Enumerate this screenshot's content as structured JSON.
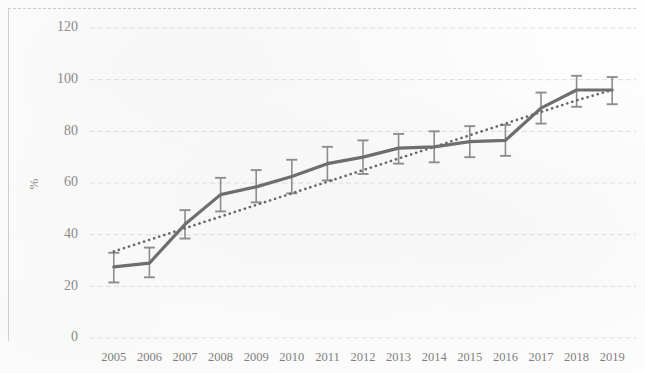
{
  "chart_data": {
    "type": "line",
    "title": "",
    "xlabel": "",
    "ylabel": "%",
    "ylim": [
      0,
      120
    ],
    "yticks": [
      0,
      20,
      40,
      60,
      80,
      100,
      120
    ],
    "grid": true,
    "legend": "none",
    "categories": [
      "2005",
      "2006",
      "2007",
      "2008",
      "2009",
      "2010",
      "2011",
      "2012",
      "2013",
      "2014",
      "2015",
      "2016",
      "2017",
      "2018",
      "2019"
    ],
    "series": [
      {
        "name": "observed",
        "style": "solid",
        "values": [
          27.5,
          29.0,
          44.0,
          55.5,
          58.5,
          62.5,
          67.5,
          70.0,
          73.5,
          74.0,
          76.0,
          76.5,
          89.0,
          96.0,
          96.0
        ],
        "error_low": [
          21.5,
          23.5,
          38.5,
          49.0,
          52.5,
          56.0,
          61.0,
          63.5,
          67.5,
          68.0,
          70.0,
          70.5,
          83.0,
          89.5,
          90.5
        ],
        "error_high": [
          33.0,
          35.0,
          49.5,
          62.0,
          65.0,
          69.0,
          74.0,
          76.5,
          79.0,
          80.0,
          82.0,
          82.5,
          95.0,
          101.5,
          101.0
        ]
      },
      {
        "name": "trend",
        "style": "dotted",
        "values": [
          33.5,
          38.0,
          42.5,
          47.0,
          51.5,
          56.0,
          60.5,
          65.0,
          69.5,
          74.0,
          78.5,
          83.0,
          87.5,
          92.0,
          96.0
        ]
      }
    ],
    "colors": {
      "series_line": "#6e6e6e",
      "trend_line": "#666666",
      "error_bar": "#8d8d8d",
      "gridline": "#d8d8d8",
      "tick_text": "#8a8a8a"
    }
  }
}
